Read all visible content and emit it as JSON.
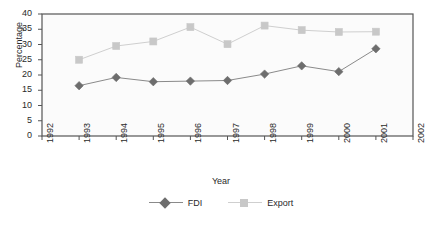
{
  "chart_data": {
    "type": "line",
    "title": "",
    "xlabel": "Year",
    "ylabel": "Percentage",
    "x": [
      1993,
      1994,
      1995,
      1996,
      1997,
      1998,
      1999,
      2000,
      2001
    ],
    "xtick_labels": [
      "1992",
      "1993",
      "1994",
      "1995",
      "1996",
      "1997",
      "1998",
      "1999",
      "2000",
      "2001",
      "2002"
    ],
    "ytick_labels": [
      "0",
      "5",
      "10",
      "15",
      "20",
      "25",
      "30",
      "35",
      "40"
    ],
    "xlim": [
      1992,
      2002
    ],
    "ylim": [
      0,
      40
    ],
    "grid": false,
    "legend_position": "bottom",
    "series": [
      {
        "name": "FDI",
        "marker": "diamond",
        "color": "#6d6d6d",
        "line_color": "#8a8a8a",
        "values": [
          16.5,
          19.2,
          17.8,
          18.0,
          18.2,
          20.3,
          23.0,
          21.1,
          28.6
        ]
      },
      {
        "name": "Export",
        "marker": "square",
        "color": "#c8c8c8",
        "line_color": "#cfcfcf",
        "values": [
          25.0,
          29.5,
          31.0,
          35.7,
          30.1,
          36.2,
          34.7,
          34.1,
          34.2
        ]
      }
    ]
  },
  "legend": {
    "items": [
      {
        "label": "FDI"
      },
      {
        "label": "Export"
      }
    ]
  },
  "axes": {
    "y_title": "Percentage",
    "x_title": "Year"
  },
  "colors": {
    "plot_background": "#fbfbfb",
    "plot_border": "#555555",
    "axis_text": "#2a2a2a",
    "fdi": "#6d6d6d",
    "export": "#c8c8c8"
  }
}
